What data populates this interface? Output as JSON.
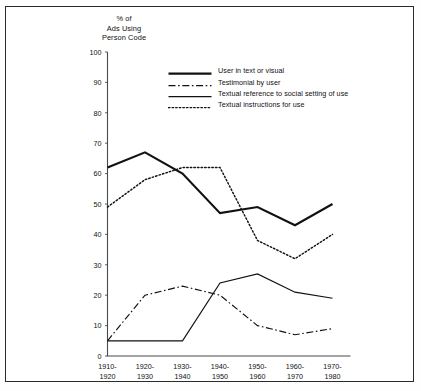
{
  "chart_data": {
    "type": "line",
    "title": "",
    "ylabel": "% of Ads Using Person Code",
    "ylabel_lines": [
      "% of",
      "Ads Using",
      "Person Code"
    ],
    "xlabel": "",
    "ylim": [
      0,
      100
    ],
    "yticks": [
      0,
      10,
      20,
      30,
      40,
      50,
      60,
      70,
      80,
      90,
      100
    ],
    "ytick_labels": [
      "0",
      "10",
      "20",
      "30",
      "40",
      "50",
      "60",
      "70",
      "80",
      "90",
      "100"
    ],
    "grid": false,
    "legend_position": "upper-center",
    "categories": [
      "1910-1920",
      "1920-1930",
      "1930-1940",
      "1940-1950",
      "1950-1960",
      "1960-1970",
      "1970-1980"
    ],
    "category_lines": [
      [
        "1910-",
        "1920"
      ],
      [
        "1920-",
        "1930"
      ],
      [
        "1930-",
        "1940"
      ],
      [
        "1940-",
        "1950"
      ],
      [
        "1950-",
        "1960"
      ],
      [
        "1960-",
        "1970"
      ],
      [
        "1970-",
        "1980"
      ]
    ],
    "series": [
      {
        "name": "User in text or visual",
        "style": "solid-thick",
        "color": "#111111",
        "values": [
          62,
          67,
          60,
          47,
          49,
          43,
          50
        ]
      },
      {
        "name": "Testimonial by user",
        "style": "dash-dot",
        "color": "#111111",
        "values": [
          5,
          20,
          23,
          20,
          10,
          7,
          9
        ]
      },
      {
        "name": "Textual reference to social setting of use",
        "style": "solid-thin",
        "color": "#111111",
        "values": [
          5,
          5,
          5,
          24,
          27,
          21,
          19
        ]
      },
      {
        "name": "Textual instructions for use",
        "style": "dotted",
        "color": "#111111",
        "values": [
          49,
          58,
          62,
          62,
          38,
          32,
          40
        ]
      }
    ]
  }
}
